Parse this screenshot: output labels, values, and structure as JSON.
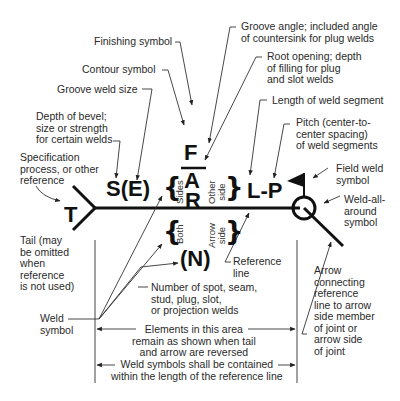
{
  "diagram": {
    "symbol": {
      "finishing": "F",
      "angle": "A",
      "root": "R",
      "tail_text": "T",
      "size": "S(E)",
      "length_pitch": "L-P",
      "number": "(N)"
    },
    "side_labels": {
      "sides": "Sides",
      "other_side": "Other\nside",
      "both": "Both",
      "arrow_side": "Arrow\nside"
    },
    "callouts": {
      "finishing_symbol": "Finishing symbol",
      "contour_symbol": "Contour symbol",
      "groove_weld_size": "Groove weld size",
      "depth_of_bevel": "Depth of bevel;\nsize or strength\nfor certain welds",
      "specification": "Specification\nprocess, or other\nreference",
      "tail": "Tail (may\nbe omitted\nwhen\nreference\nis not used)",
      "weld_symbol": "Weld\nsymbol",
      "groove_angle": "Groove angle; included angle\nof countersink for plug welds",
      "root_opening": "Root opening; depth\nof filling for plug\nand slot welds",
      "length_of_segment": "Length of weld segment",
      "pitch": "Pitch (center-to-\ncenter spacing)\nof weld segments",
      "field_weld": "Field weld\nsymbol",
      "weld_all_around": "Weld-all-\naround\nsymbol",
      "reference_line": "Reference\nline",
      "arrow_connecting": "Arrow\nconnecting\nreference\nline to arrow\nside member\nof joint or\narrow side\nof joint",
      "number_of_welds": "Number of spot, seam,\nstud, plug, slot,\nor projection welds",
      "elements_area": "Elements in this area\nremain as shown when tail\nand arrow are reversed",
      "contained": "Weld symbols shall be contained\nwithin the length of the reference line"
    }
  }
}
